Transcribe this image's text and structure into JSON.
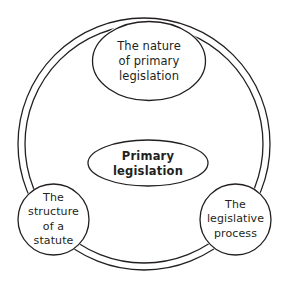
{
  "diagram": {
    "type": "cycle-diagram",
    "title": "Primary legislation",
    "background_color": "#ffffff",
    "stroke_color": "#231f20",
    "center": {
      "label": "Primary\nlegislation",
      "shape": "ellipse",
      "emphasis": "bold"
    },
    "ring": {
      "shape": "double-arc-ring",
      "segments": 3
    },
    "nodes": [
      {
        "id": "top",
        "shape": "ellipse",
        "label": "The nature\nof primary\nlegislation"
      },
      {
        "id": "bottom-left",
        "shape": "circle",
        "label": "The\nstructure\nof a\nstatute"
      },
      {
        "id": "bottom-right",
        "shape": "circle",
        "label": "The\nlegislative\nprocess"
      }
    ]
  }
}
